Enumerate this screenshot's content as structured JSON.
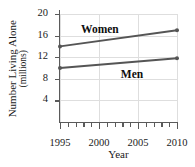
{
  "chart_data": {
    "type": "line",
    "title": "",
    "xlabel": "Year",
    "ylabel_line1": "Number Living Alone",
    "ylabel_line2": "(millions)",
    "x": [
      1995,
      2010
    ],
    "xlim": [
      1995,
      2010
    ],
    "ylim": [
      0,
      20
    ],
    "xticks_major": [
      1995,
      2000,
      2005,
      2010
    ],
    "xticks_major_labels": [
      "1995",
      "2000",
      "2005",
      "2010"
    ],
    "xticks_minor": [
      1996,
      1997,
      1998,
      1999,
      2001,
      2002,
      2003,
      2004,
      2006,
      2007,
      2008,
      2009
    ],
    "yticks": [
      4,
      8,
      12,
      16,
      20
    ],
    "ytick_labels": [
      "4",
      "8",
      "12",
      "16",
      "20"
    ],
    "grid": "light gray horizontal at y ticks and vertical at major x ticks",
    "legend_position": "inline annotations on plot",
    "series": [
      {
        "name": "Women",
        "label": "Women",
        "values": [
          14.0,
          17.0
        ],
        "color": "#555555",
        "label_x_pct": 18,
        "label_y_pct": 8
      },
      {
        "name": "Men",
        "label": "Men",
        "values": [
          10.0,
          11.8
        ],
        "color": "#555555",
        "label_x_pct": 52,
        "label_y_pct": 50
      }
    ],
    "marker": "filled-circle",
    "axis_color": "#5a5a5a",
    "grid_color": "#dedede",
    "text_color": "#1a1a1a"
  }
}
